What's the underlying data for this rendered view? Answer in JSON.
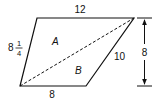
{
  "diagram": {
    "type": "trapezoid-area",
    "shape": "trapezoid split by dashed diagonal into two triangles",
    "labels": {
      "top_side": "12",
      "left_side_whole": "8",
      "left_side_num": "1",
      "left_side_den": "4",
      "right_side": "10",
      "bottom_side": "8",
      "height": "8",
      "region_a": "A",
      "region_b": "B"
    },
    "colors": {
      "stroke": "#111111",
      "background": "#ffffff"
    }
  }
}
